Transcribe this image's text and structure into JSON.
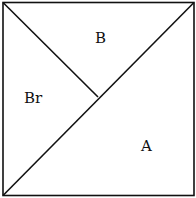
{
  "diagram": {
    "type": "square partitioned into triangles",
    "stroke_color": "#111111",
    "background": "#ffffff",
    "regions": [
      {
        "id": "B",
        "label": "B"
      },
      {
        "id": "Br",
        "label": "Br"
      },
      {
        "id": "A",
        "label": "A"
      }
    ]
  }
}
